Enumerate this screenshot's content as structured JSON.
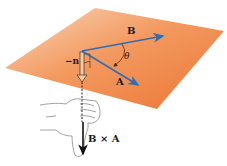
{
  "figure": {
    "plane": {
      "color_light": "#f7cba7",
      "color_dark": "#ee7d3e",
      "corners": [
        [
          95,
          8
        ],
        [
          224,
          31
        ],
        [
          157,
          109
        ],
        [
          5,
          68
        ]
      ]
    },
    "origin": [
      82,
      51
    ],
    "vectors": {
      "B": {
        "label": "B",
        "end": [
          165,
          36
        ],
        "color": "#2f6db5"
      },
      "A": {
        "label": "A",
        "end": [
          140,
          86
        ],
        "color": "#2f6db5"
      },
      "neg_n": {
        "label": "−n",
        "end": [
          82,
          80
        ],
        "color": "#222222"
      },
      "cross": {
        "label": "B × A",
        "start": [
          83,
          122
        ],
        "end": [
          83,
          156
        ],
        "color": "#111111"
      }
    },
    "angle": {
      "label": "θ"
    }
  }
}
